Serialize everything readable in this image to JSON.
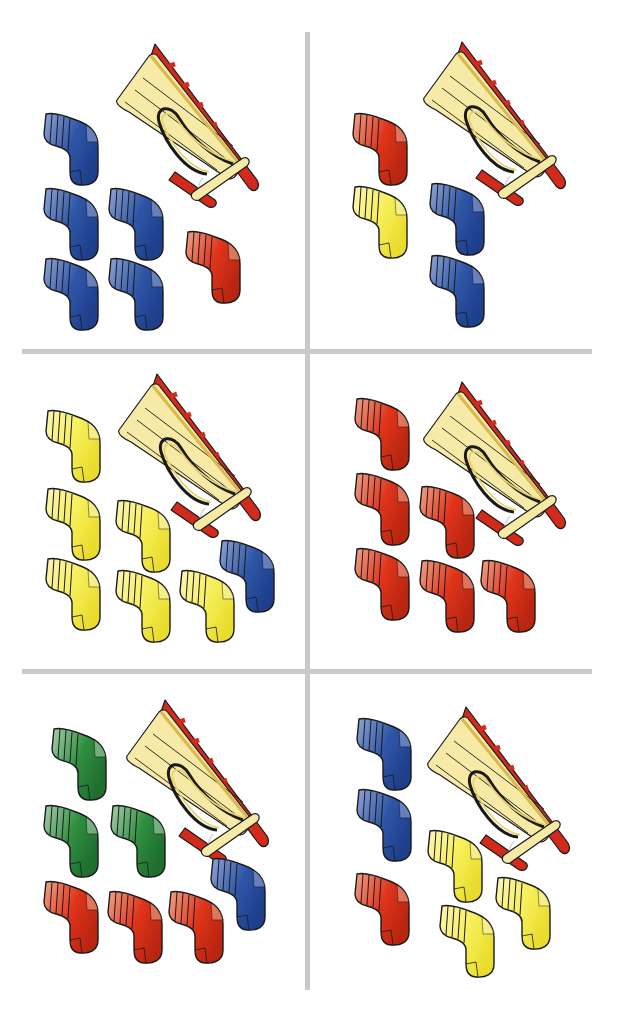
{
  "colors": {
    "divider": "#c9c9c9",
    "sock": {
      "blue": {
        "light": "#8fa5d6",
        "main": "#2f56a6",
        "dark": "#1d3f8c"
      },
      "red": {
        "light": "#f0a48a",
        "main": "#e0341a",
        "dark": "#b82510"
      },
      "yellow": {
        "light": "#fbf6b8",
        "main": "#f7ef5a",
        "dark": "#e9dc2c"
      },
      "green": {
        "light": "#a9cfae",
        "main": "#2f8f40",
        "dark": "#1f6e2e"
      }
    },
    "sled": {
      "board": "#f7eaa6",
      "runner": "#d22b1c",
      "rope": "#e8d36a",
      "outline": "#1a1a1a"
    }
  },
  "panels": [
    {
      "id": "panel-1",
      "sled": true,
      "socks": [
        {
          "color": "blue",
          "x": 40,
          "y": 110
        },
        {
          "color": "blue",
          "x": 40,
          "y": 185
        },
        {
          "color": "blue",
          "x": 105,
          "y": 185
        },
        {
          "color": "blue",
          "x": 40,
          "y": 255
        },
        {
          "color": "blue",
          "x": 105,
          "y": 255
        },
        {
          "color": "red",
          "x": 182,
          "y": 228
        }
      ]
    },
    {
      "id": "panel-2",
      "sled": true,
      "socks": [
        {
          "color": "red",
          "x": 40,
          "y": 110
        },
        {
          "color": "yellow",
          "x": 40,
          "y": 183
        },
        {
          "color": "blue",
          "x": 117,
          "y": 180
        },
        {
          "color": "blue",
          "x": 117,
          "y": 252
        }
      ]
    },
    {
      "id": "panel-3",
      "sled": true,
      "socks": [
        {
          "color": "yellow",
          "x": 42,
          "y": 62
        },
        {
          "color": "yellow",
          "x": 42,
          "y": 140
        },
        {
          "color": "yellow",
          "x": 112,
          "y": 152
        },
        {
          "color": "blue",
          "x": 216,
          "y": 192
        },
        {
          "color": "yellow",
          "x": 42,
          "y": 210
        },
        {
          "color": "yellow",
          "x": 112,
          "y": 222
        },
        {
          "color": "yellow",
          "x": 176,
          "y": 222
        }
      ]
    },
    {
      "id": "panel-4",
      "sled": true,
      "socks": [
        {
          "color": "red",
          "x": 42,
          "y": 50
        },
        {
          "color": "red",
          "x": 42,
          "y": 125
        },
        {
          "color": "red",
          "x": 107,
          "y": 138
        },
        {
          "color": "red",
          "x": 42,
          "y": 200
        },
        {
          "color": "red",
          "x": 107,
          "y": 212
        },
        {
          "color": "red",
          "x": 168,
          "y": 212
        }
      ]
    },
    {
      "id": "panel-5",
      "sled": true,
      "socks": [
        {
          "color": "green",
          "x": 48,
          "y": 55
        },
        {
          "color": "green",
          "x": 40,
          "y": 132
        },
        {
          "color": "green",
          "x": 107,
          "y": 132
        },
        {
          "color": "blue",
          "x": 207,
          "y": 185
        },
        {
          "color": "red",
          "x": 40,
          "y": 208
        },
        {
          "color": "red",
          "x": 104,
          "y": 218
        },
        {
          "color": "red",
          "x": 165,
          "y": 218
        }
      ]
    },
    {
      "id": "panel-6",
      "sled": true,
      "socks": [
        {
          "color": "blue",
          "x": 44,
          "y": 45
        },
        {
          "color": "blue",
          "x": 44,
          "y": 116
        },
        {
          "color": "yellow",
          "x": 115,
          "y": 157
        },
        {
          "color": "red",
          "x": 42,
          "y": 200
        },
        {
          "color": "yellow",
          "x": 183,
          "y": 204
        },
        {
          "color": "yellow",
          "x": 127,
          "y": 232
        }
      ]
    }
  ],
  "layout": {
    "panels": [
      {
        "left": 0,
        "top": 0
      },
      {
        "left": 309,
        "top": 0
      },
      {
        "left": 0,
        "top": 345
      },
      {
        "left": 309,
        "top": 345
      },
      {
        "left": 0,
        "top": 670
      },
      {
        "left": 309,
        "top": 670
      }
    ],
    "sled": [
      {
        "x": 115,
        "y": 42
      },
      {
        "x": 113,
        "y": 40
      },
      {
        "x": 117,
        "y": 27
      },
      {
        "x": 113,
        "y": 35
      },
      {
        "x": 125,
        "y": 28
      },
      {
        "x": 117,
        "y": 35
      }
    ],
    "hlines": [
      351,
      670
    ]
  }
}
